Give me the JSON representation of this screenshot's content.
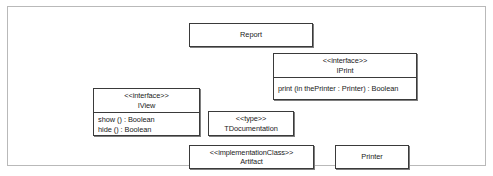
{
  "diagram": {
    "kind": "uml-class-diagram",
    "frame_border_color": "#b9b9b9",
    "node_border_color": "#3a3a3a",
    "node_fill_color": "#ffffff",
    "text_color": "#1a1a1a",
    "nodes": {
      "report": {
        "name": "Report",
        "stereotype": "",
        "operations": []
      },
      "iprint": {
        "stereotype": "<<interface>>",
        "name": "IPrint",
        "operations": [
          "print (in thePrinter : Printer) : Boolean"
        ]
      },
      "iview": {
        "stereotype": "<<interface>>",
        "name": "IView",
        "operations": [
          "show () : Boolean",
          "hide () : Boolean"
        ]
      },
      "tdocumentation": {
        "stereotype": "<<type>>",
        "name": "TDocumentation",
        "operations": []
      },
      "artifact": {
        "stereotype": "<<implementationClass>>",
        "name": "Artifact",
        "operations": []
      },
      "printer": {
        "name": "Printer",
        "stereotype": "",
        "operations": []
      }
    }
  }
}
